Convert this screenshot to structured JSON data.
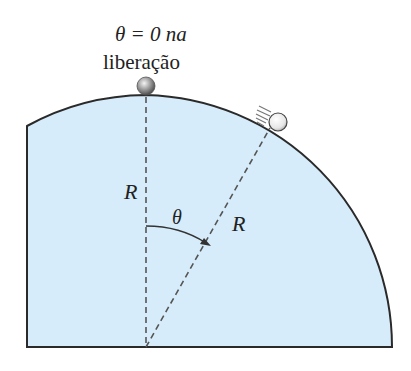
{
  "diagram": {
    "release_label_line1": "θ = 0 na",
    "release_label_line2": "liberação",
    "radius_label_vertical": "R",
    "radius_label_slanted": "R",
    "angle_label": "θ",
    "colors": {
      "fill": "#d6ecfa",
      "outline": "#2a2a2a",
      "dashed": "#555555",
      "ball_top": "#8a8a8a",
      "ball_moving": "#eeeeee"
    }
  }
}
